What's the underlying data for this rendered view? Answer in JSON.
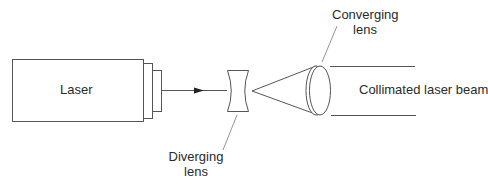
{
  "diagram": {
    "components": {
      "laser": {
        "label": "Laser"
      },
      "diverging_lens": {
        "label_line1": "Diverging",
        "label_line2": "lens"
      },
      "converging_lens": {
        "label_line1": "Converging",
        "label_line2": "lens"
      },
      "output_beam": {
        "label": "Collimated laser beam"
      }
    },
    "colors": {
      "stroke": "#555555",
      "text": "#2a2a2a",
      "background": "#ffffff"
    }
  }
}
